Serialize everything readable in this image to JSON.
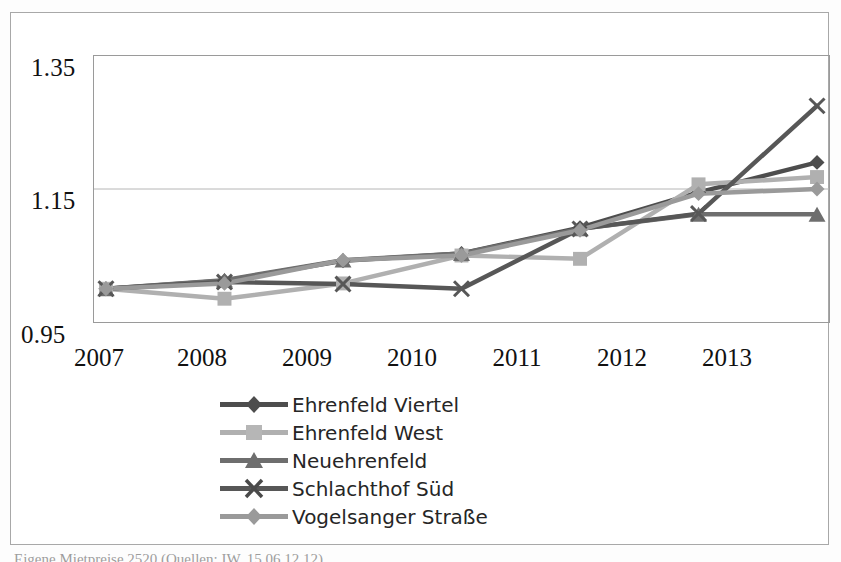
{
  "figure": {
    "caption": "Eigene Mietpreise 2520 (Quellen: IW, 15.06.12.12)"
  },
  "axes": {
    "y_ticks": [
      "1.35",
      "1.15",
      "0.95"
    ],
    "x_ticks": [
      "2007",
      "2008",
      "2009",
      "2010",
      "2011",
      "2012",
      "2013"
    ]
  },
  "legend": [
    {
      "label": "Ehrenfeld Viertel",
      "marker": "diamond",
      "color": "#4d4d4d"
    },
    {
      "label": "Ehrenfeld West",
      "marker": "square",
      "color": "#b0b0b0"
    },
    {
      "label": "Neuehrenfeld",
      "marker": "triangle",
      "color": "#6e6e6e"
    },
    {
      "label": "Schlachthof Süd",
      "marker": "cross",
      "color": "#575757"
    },
    {
      "label": "Vogelsanger Straße",
      "marker": "diamond",
      "color": "#9a9a9a"
    }
  ],
  "chart_data": {
    "type": "line",
    "title": "",
    "xlabel": "",
    "ylabel": "",
    "x": [
      2007,
      2008,
      2009,
      2010,
      2011,
      2012,
      2013
    ],
    "ylim": [
      0.95,
      1.35
    ],
    "yticks": [
      0.95,
      1.15,
      1.35
    ],
    "grid": true,
    "legend_position": "bottom",
    "series": [
      {
        "name": "Ehrenfeld Viertel",
        "color": "#4d4d4d",
        "marker": "diamond",
        "values": [
          1.0,
          1.012,
          1.042,
          1.053,
          1.092,
          1.145,
          1.19
        ]
      },
      {
        "name": "Ehrenfeld West",
        "color": "#b0b0b0",
        "marker": "square",
        "values": [
          1.0,
          0.985,
          1.008,
          1.05,
          1.045,
          1.157,
          1.168
        ]
      },
      {
        "name": "Neuehrenfeld",
        "color": "#6e6e6e",
        "marker": "triangle",
        "values": [
          1.0,
          1.013,
          1.043,
          1.053,
          1.09,
          1.112,
          1.112
        ]
      },
      {
        "name": "Schlachthof Süd",
        "color": "#575757",
        "marker": "cross",
        "values": [
          1.0,
          1.01,
          1.007,
          1.0,
          1.09,
          1.113,
          1.275
        ]
      },
      {
        "name": "Vogelsanger Straße",
        "color": "#9a9a9a",
        "marker": "diamond",
        "values": [
          1.0,
          1.008,
          1.043,
          1.05,
          1.088,
          1.143,
          1.15
        ]
      }
    ]
  }
}
